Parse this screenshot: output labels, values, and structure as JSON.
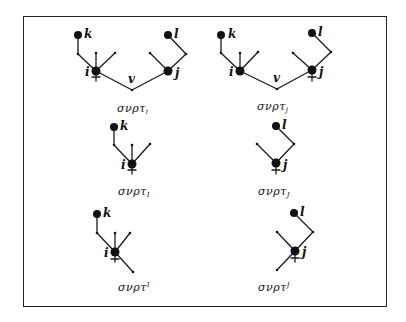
{
  "figure": {
    "panels": [
      {
        "id": "top-left",
        "caption_base": "σνρτ",
        "caption_index": "i",
        "caption_position": "subscript",
        "labels": {
          "k": "k",
          "l": "l",
          "i": "i",
          "j": "j",
          "v": "v"
        }
      },
      {
        "id": "top-right",
        "caption_base": "σνρτ",
        "caption_index": "j",
        "caption_position": "subscript",
        "labels": {
          "k": "k",
          "l": "l",
          "i": "i",
          "j": "j",
          "v": "v"
        }
      },
      {
        "id": "middle-left",
        "caption_base": "σνρτ",
        "caption_index": "I",
        "caption_position": "subscript",
        "labels": {
          "k": "k",
          "i": "i"
        }
      },
      {
        "id": "middle-right",
        "caption_base": "σνρτ",
        "caption_index": "J",
        "caption_position": "subscript",
        "labels": {
          "l": "l",
          "j": "j"
        }
      },
      {
        "id": "bottom-left",
        "caption_base": "σνρτ",
        "caption_index": "I",
        "caption_position": "superscript",
        "labels": {
          "k": "k",
          "i": "i"
        }
      },
      {
        "id": "bottom-right",
        "caption_base": "σνρτ",
        "caption_index": "J",
        "caption_position": "superscript",
        "labels": {
          "l": "l",
          "j": "j"
        }
      }
    ]
  }
}
